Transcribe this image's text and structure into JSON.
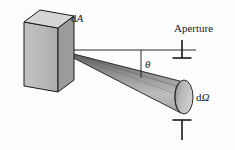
{
  "figure": {
    "background_color": "#fdfdfd",
    "stroke_color": "#1a1a1a",
    "labels": {
      "surface_element": "dA",
      "surface_element_d": "d",
      "surface_element_symbol": "A",
      "aperture": "Aperture",
      "angle": "θ",
      "solid_angle": "dΩ",
      "solid_angle_d": "d",
      "solid_angle_symbol": "Ω"
    },
    "colors": {
      "box_front_face": "#b9b9b9",
      "box_top_face": "#d4d4d4",
      "box_side_face": "#9a9a9a",
      "cone_upper_band": "#6e6e6e",
      "cone_mid_band": "#8f8f8f",
      "cone_lower_band": "#c2c2c2",
      "cone_endcap": "#b5b5b5",
      "outline": "#1a1a1a",
      "axis_line": "#2a2a2a"
    },
    "geometry": {
      "box": {
        "front_face": "24,22 58,28 58,92 24,86",
        "top_face": "24,22 40,10 74,16 58,28",
        "side_face": "58,28 74,16 74,80 58,92",
        "apex_point": [
          58,
          50
        ]
      },
      "cone": {
        "apex": [
          58,
          50
        ],
        "end_center": [
          184,
          97
        ],
        "end_rx": 9,
        "end_ry": 17,
        "half_angle_deg": 7
      },
      "axis": {
        "start": [
          58,
          50
        ],
        "end": [
          196,
          50
        ]
      },
      "theta_drop_line": {
        "start": [
          141,
          50
        ],
        "end": [
          141,
          78
        ]
      },
      "aperture_tick_top": {
        "stem_x": 182,
        "stem_top": 40,
        "stem_bottom": 58,
        "bar_y": 58,
        "bar_x1": 173,
        "bar_x2": 191
      },
      "aperture_tick_bottom": {
        "stem_x": 182,
        "stem_top": 120,
        "stem_bottom": 140,
        "bar_y": 120,
        "bar_x1": 173,
        "bar_x2": 191
      }
    }
  }
}
